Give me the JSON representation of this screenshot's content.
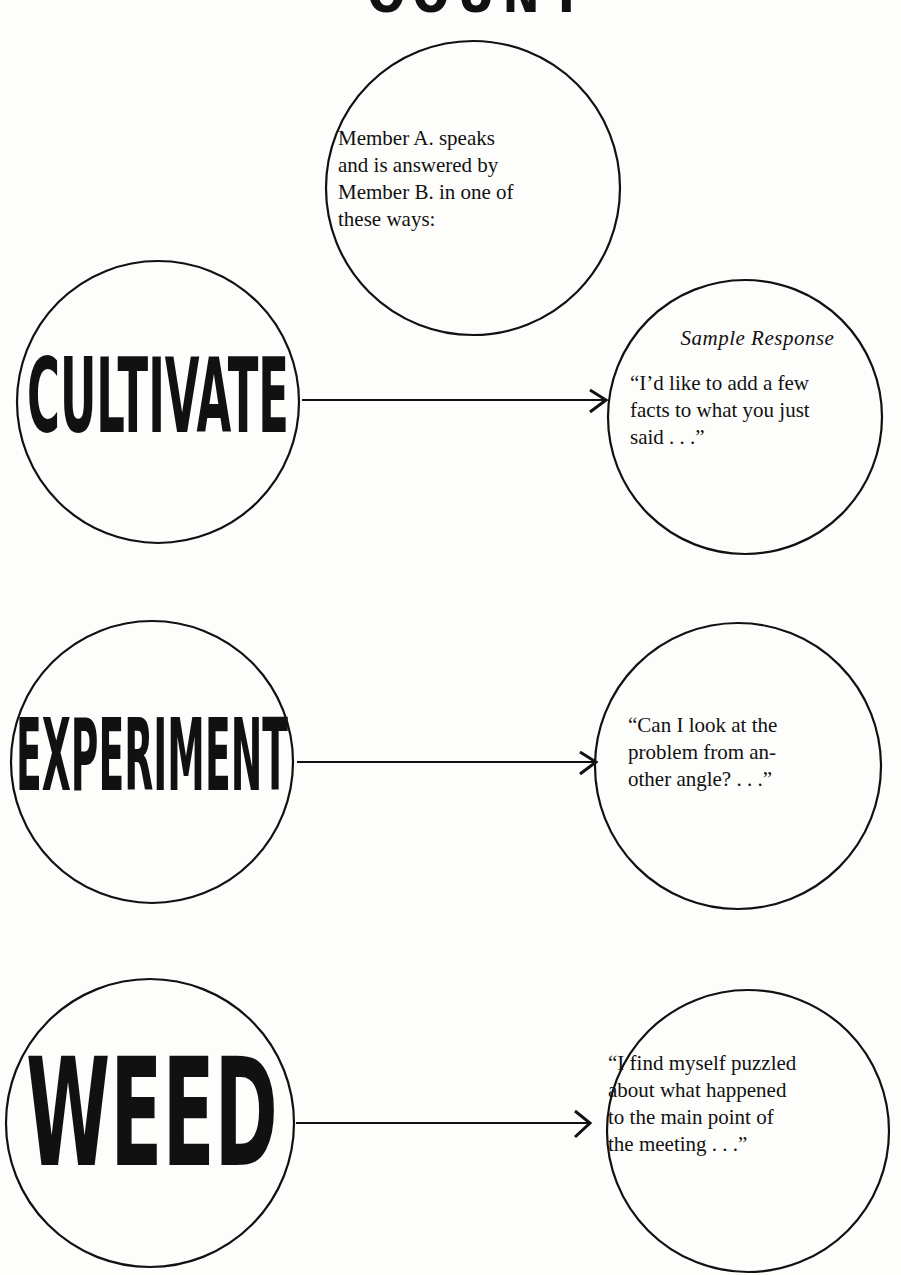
{
  "page": {
    "title": "COUNT"
  },
  "intro": {
    "text": "Member A. speaks and is answered by Member B. in one of these ways:",
    "lines": [
      "Member A. speaks",
      "and is answered by",
      "Member B. in one of",
      "these ways:"
    ]
  },
  "rows": [
    {
      "word": "CULTIVATE",
      "sample_label": "Sample Response",
      "response_lines": [
        "“I’d like to add a few",
        "facts to what you just",
        "said . . .”"
      ]
    },
    {
      "word": "EXPERIMENT",
      "response_lines": [
        "“Can I look at the",
        "problem from an-",
        "other angle? . . .”"
      ]
    },
    {
      "word": "WEED",
      "response_lines": [
        "“I find myself puzzled",
        "about what happened",
        "to the main point of",
        "the meeting . . .”"
      ]
    }
  ],
  "colors": {
    "ink": "#111111",
    "paper": "#fdfdfb"
  }
}
